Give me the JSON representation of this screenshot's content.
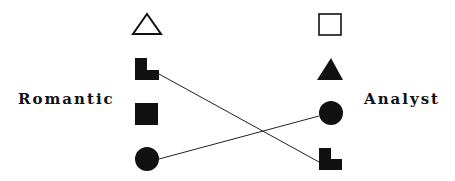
{
  "diagram": {
    "left_group": {
      "label": "Romantic",
      "items": [
        {
          "shape": "triangle-outline-icon"
        },
        {
          "shape": "l-shape-filled-icon"
        },
        {
          "shape": "square-filled-icon"
        },
        {
          "shape": "circle-filled-icon"
        }
      ]
    },
    "right_group": {
      "label": "Analyst",
      "items": [
        {
          "shape": "square-outline-icon"
        },
        {
          "shape": "triangle-filled-icon"
        },
        {
          "shape": "circle-filled-icon"
        },
        {
          "shape": "l-shape-filled-icon"
        }
      ]
    },
    "connections": [
      {
        "from": "left.l-shape",
        "to": "right.l-shape"
      },
      {
        "from": "left.circle",
        "to": "right.circle"
      }
    ],
    "colors": {
      "ink": "#111111",
      "background": "#ffffff"
    }
  }
}
